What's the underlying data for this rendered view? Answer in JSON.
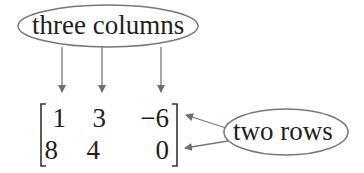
{
  "diagram": {
    "columns_label": "three columns",
    "rows_label": "two rows",
    "matrix": {
      "rows": [
        [
          "1",
          "3",
          "−6"
        ],
        [
          "8",
          "4",
          "0"
        ]
      ]
    },
    "colors": {
      "stroke": "#777777",
      "text": "#1e1e1e"
    }
  }
}
